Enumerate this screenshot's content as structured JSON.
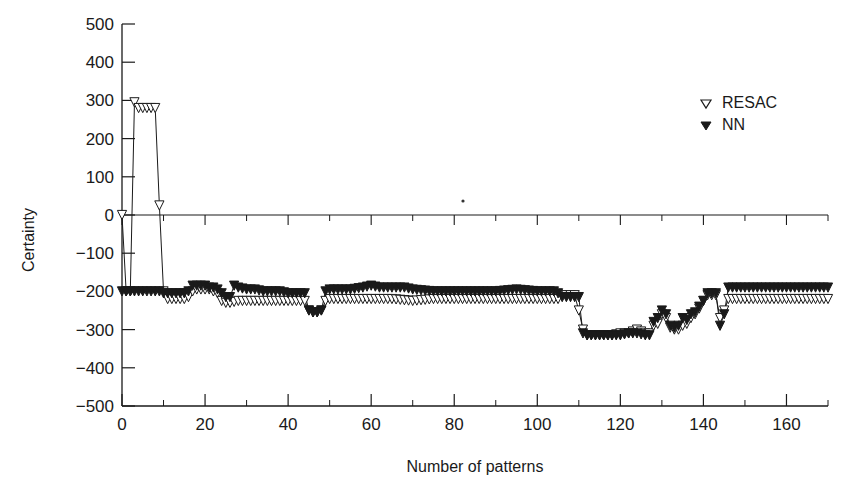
{
  "chart_data": {
    "type": "line",
    "title": "",
    "xlabel": "Number of patterns",
    "ylabel": "Certainty",
    "xlim": [
      0,
      170
    ],
    "ylim": [
      -500,
      500
    ],
    "x_ticks": [
      0,
      20,
      40,
      60,
      80,
      100,
      120,
      140,
      160
    ],
    "x_minor_ticks": [
      10,
      30,
      50,
      70,
      90,
      110,
      130,
      150,
      170
    ],
    "y_ticks": [
      500,
      400,
      300,
      200,
      100,
      0,
      -100,
      -200,
      -300,
      -400,
      -500
    ],
    "y_tick_labels": [
      "500",
      "400",
      "300",
      "200",
      "100",
      "0",
      "−100",
      "−200",
      "−300",
      "−400",
      "−500"
    ],
    "x_tick_labels": [
      "0",
      "20",
      "40",
      "60",
      "80",
      "100",
      "120",
      "140",
      "160"
    ],
    "grid": false,
    "zero_line": true,
    "legend": {
      "position": "upper right",
      "entries": [
        {
          "label": "RESAC",
          "marker": "open-triangle-down"
        },
        {
          "label": "NN",
          "marker": "filled-triangle-down"
        }
      ]
    },
    "series": [
      {
        "name": "RESAC",
        "marker": "open-triangle-down",
        "x": [
          0,
          1,
          2,
          3,
          4,
          5,
          6,
          7,
          8,
          9,
          10,
          11,
          12,
          13,
          14,
          15,
          16,
          17,
          18,
          19,
          20,
          21,
          22,
          23,
          24,
          25,
          26,
          28,
          30,
          32,
          34,
          36,
          38,
          40,
          42,
          44,
          45,
          46,
          47,
          48,
          49,
          50,
          55,
          60,
          65,
          70,
          75,
          80,
          85,
          90,
          95,
          100,
          104,
          105,
          106,
          107,
          108,
          109,
          110,
          111,
          112,
          114,
          116,
          118,
          120,
          122,
          124,
          126,
          127,
          128,
          129,
          130,
          131,
          132,
          133,
          134,
          135,
          136,
          137,
          138,
          139,
          140,
          141,
          142,
          143,
          144,
          145,
          146,
          150,
          155,
          160,
          165,
          170
        ],
        "values": [
          0,
          -200,
          -200,
          295,
          280,
          280,
          280,
          280,
          280,
          25,
          -200,
          -220,
          -220,
          -220,
          -220,
          -220,
          -215,
          -200,
          -195,
          -195,
          -195,
          -195,
          -200,
          -205,
          -225,
          -230,
          -230,
          -225,
          -225,
          -225,
          -225,
          -225,
          -225,
          -225,
          -225,
          -225,
          -250,
          -255,
          -255,
          -250,
          -225,
          -220,
          -220,
          -220,
          -220,
          -225,
          -220,
          -220,
          -220,
          -220,
          -220,
          -220,
          -220,
          -220,
          -210,
          -210,
          -210,
          -210,
          -250,
          -300,
          -315,
          -315,
          -315,
          -315,
          -310,
          -310,
          -300,
          -310,
          -310,
          -290,
          -285,
          -260,
          -270,
          -295,
          -300,
          -300,
          -290,
          -285,
          -270,
          -260,
          -245,
          -225,
          -210,
          -210,
          -210,
          -270,
          -250,
          -220,
          -220,
          -220,
          -220,
          -220,
          -220
        ]
      },
      {
        "name": "NN",
        "marker": "filled-triangle-down",
        "x": [
          0,
          1,
          2,
          3,
          4,
          5,
          6,
          7,
          8,
          9,
          10,
          11,
          12,
          13,
          14,
          15,
          16,
          17,
          18,
          19,
          20,
          21,
          22,
          23,
          24,
          25,
          26,
          27,
          28,
          30,
          32,
          34,
          36,
          38,
          40,
          42,
          44,
          45,
          46,
          47,
          48,
          49,
          50,
          55,
          58,
          60,
          62,
          65,
          68,
          70,
          75,
          80,
          85,
          90,
          95,
          100,
          104,
          105,
          106,
          107,
          108,
          109,
          110,
          111,
          112,
          114,
          116,
          118,
          120,
          122,
          124,
          126,
          127,
          128,
          129,
          130,
          131,
          132,
          133,
          134,
          135,
          136,
          137,
          138,
          139,
          140,
          141,
          142,
          143,
          144,
          145,
          146,
          150,
          155,
          160,
          165,
          170
        ],
        "values": [
          -200,
          -200,
          -200,
          -200,
          -200,
          -200,
          -200,
          -200,
          -200,
          -200,
          -205,
          -205,
          -205,
          -205,
          -205,
          -205,
          -200,
          -185,
          -185,
          -185,
          -185,
          -190,
          -190,
          -195,
          -205,
          -215,
          -215,
          -185,
          -190,
          -195,
          -195,
          -200,
          -200,
          -200,
          -205,
          -205,
          -205,
          -250,
          -255,
          -255,
          -250,
          -200,
          -195,
          -195,
          -190,
          -185,
          -190,
          -190,
          -190,
          -195,
          -200,
          -200,
          -200,
          -200,
          -195,
          -200,
          -200,
          -205,
          -215,
          -215,
          -215,
          -215,
          -215,
          -310,
          -315,
          -315,
          -315,
          -315,
          -315,
          -310,
          -310,
          -315,
          -315,
          -280,
          -270,
          -250,
          -260,
          -290,
          -295,
          -290,
          -270,
          -275,
          -260,
          -255,
          -240,
          -225,
          -205,
          -205,
          -205,
          -290,
          -260,
          -190,
          -190,
          -190,
          -190,
          -190,
          -190
        ]
      }
    ],
    "annotations": []
  },
  "labels": {
    "y_axis_title": "Certainty",
    "x_axis_title": "Number of patterns",
    "legend_resac": "RESAC",
    "legend_nn": "NN",
    "panel_label": "(b)"
  }
}
